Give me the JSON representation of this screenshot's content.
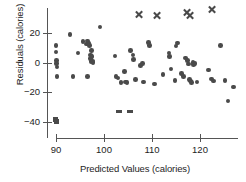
{
  "chart_data": {
    "type": "scatter",
    "title": "",
    "xlabel": "Predicted Values (calories)",
    "ylabel": "Residuals (calories)",
    "xlim": [
      87.5,
      128.5
    ],
    "ylim": [
      -45,
      36
    ],
    "grid": false,
    "legend": null,
    "xticks": [
      90,
      100,
      110,
      120
    ],
    "yticks": [
      20,
      0,
      -20,
      -40
    ],
    "xtick_labels": [
      "90",
      "100",
      "110",
      "120"
    ],
    "ytick_labels": [
      "20",
      "0",
      "−20",
      "−40"
    ],
    "marker_color": "#4a4a4a",
    "series": [
      {
        "name": "residuals",
        "marker": "circle",
        "points": [
          [
            90.0,
            11.5
          ],
          [
            90.0,
            7.0
          ],
          [
            90.1,
            1.5
          ],
          [
            90.1,
            -0.5
          ],
          [
            90.2,
            -3.0
          ],
          [
            90.2,
            -9.5
          ],
          [
            92.9,
            19.0
          ],
          [
            93.5,
            -9.5
          ],
          [
            94.6,
            6.5
          ],
          [
            95.6,
            14.0
          ],
          [
            96.4,
            12.5
          ],
          [
            96.6,
            14.5
          ],
          [
            96.9,
            13.0
          ],
          [
            97.0,
            11.5
          ],
          [
            97.2,
            5.0
          ],
          [
            97.2,
            2.5
          ],
          [
            97.3,
            0.5
          ],
          [
            97.4,
            8.0
          ],
          [
            97.5,
            4.0
          ],
          [
            97.6,
            1.0
          ],
          [
            97.7,
            0.0
          ],
          [
            96.6,
            -9.5
          ],
          [
            99.2,
            24.0
          ],
          [
            102.3,
            4.5
          ],
          [
            102.5,
            -9.5
          ],
          [
            102.9,
            -10.5
          ],
          [
            103.5,
            -13.5
          ],
          [
            104.3,
            -6.0
          ],
          [
            104.5,
            -13.0
          ],
          [
            104.8,
            -13.5
          ],
          [
            105.5,
            8.0
          ],
          [
            106.0,
            5.0
          ],
          [
            106.2,
            2.0
          ],
          [
            106.6,
            -11.5
          ],
          [
            107.6,
            -2.0
          ],
          [
            108.0,
            -0.5
          ],
          [
            108.2,
            -13.0
          ],
          [
            109.3,
            13.5
          ],
          [
            109.5,
            11.5
          ],
          [
            110.5,
            -14.5
          ],
          [
            112.3,
            -8.0
          ],
          [
            113.5,
            6.5
          ],
          [
            113.7,
            4.0
          ],
          [
            114.0,
            -4.5
          ],
          [
            114.8,
            -12.0
          ],
          [
            115.0,
            11.0
          ],
          [
            115.3,
            13.0
          ],
          [
            116.2,
            -7.5
          ],
          [
            116.6,
            -9.5
          ],
          [
            117.0,
            3.0
          ],
          [
            117.4,
            1.5
          ],
          [
            117.6,
            -1.0
          ],
          [
            117.8,
            -11.5
          ],
          [
            118.0,
            -12.5
          ],
          [
            118.2,
            -13.5
          ],
          [
            118.5,
            0.0
          ],
          [
            118.7,
            -1.5
          ],
          [
            119.0,
            -0.5
          ],
          [
            119.4,
            -13.0
          ],
          [
            121.8,
            -5.0
          ],
          [
            122.4,
            -11.0
          ],
          [
            122.8,
            -12.5
          ],
          [
            124.3,
            11.5
          ],
          [
            125.2,
            -12.0
          ],
          [
            125.8,
            -26.0
          ],
          [
            127.0,
            -16.5
          ]
        ]
      },
      {
        "name": "low-outliers",
        "marker": "square",
        "points": [
          [
            89.9,
            -38.5
          ],
          [
            90.2,
            -39.5
          ]
        ]
      },
      {
        "name": "low-outlier-dashes",
        "marker": "dash",
        "points": [
          [
            103.2,
            -33.0
          ],
          [
            105.5,
            -33.0
          ]
        ]
      },
      {
        "name": "high-outliers",
        "marker": "x",
        "points": [
          [
            107.3,
            32.5
          ],
          [
            111.0,
            31.5
          ],
          [
            117.4,
            33.5
          ],
          [
            117.9,
            31.5
          ],
          [
            122.6,
            35.5
          ]
        ]
      }
    ]
  }
}
